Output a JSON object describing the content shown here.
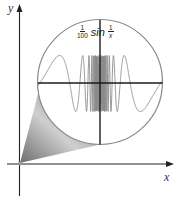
{
  "figure": {
    "type": "magnified-graph-diagram",
    "axes": {
      "x_label": "x",
      "y_label": "y"
    },
    "magnifier": {
      "formula": {
        "coefficient_numerator": "1",
        "coefficient_denominator": "100",
        "function": "sin",
        "arg_numerator": "1",
        "arg_denominator": "x"
      },
      "description": "Magnified view near origin of (1/100) sin(1/x)"
    },
    "colors": {
      "axis": "#222222",
      "circle": "#8a8a8a",
      "wave": "#8c8c8c",
      "cone_dark": "#7a7a7a",
      "cone_light": "#d8d8d8",
      "background": "#ffffff"
    }
  }
}
